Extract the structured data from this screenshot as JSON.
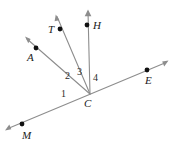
{
  "figure": {
    "type": "geometry-ray-diagram",
    "background_color": "#ffffff",
    "line_color": "#8d8d8d",
    "dot_color": "#111111",
    "label_color": "#1a1a1a"
  },
  "vertex": {
    "name": "C",
    "label": "C",
    "x": 90,
    "y": 94,
    "label_x": 92,
    "label_y": 106
  },
  "points": [
    {
      "name": "A",
      "label": "A",
      "dot_x": 36,
      "dot_y": 48,
      "label_x": 27,
      "label_y": 61,
      "arrow_x": 25,
      "arrow_y": 37
    },
    {
      "name": "T",
      "label": "T",
      "dot_x": 60,
      "dot_y": 29,
      "label_x": 48,
      "label_y": 33,
      "arrow_x": 56,
      "arrow_y": 15
    },
    {
      "name": "H",
      "label": "H",
      "dot_x": 87,
      "dot_y": 25,
      "label_x": 93,
      "label_y": 29,
      "arrow_x": 88,
      "arrow_y": 10
    },
    {
      "name": "E",
      "label": "E",
      "dot_x": 147,
      "dot_y": 70,
      "label_x": 145,
      "label_y": 84,
      "arrow_x": 168,
      "arrow_y": 61
    },
    {
      "name": "M",
      "label": "M",
      "dot_x": 22,
      "dot_y": 124,
      "label_x": 22,
      "label_y": 139,
      "arrow_x": 6,
      "arrow_y": 130
    }
  ],
  "angles": [
    {
      "label": "1",
      "x": 64,
      "y": 94
    },
    {
      "label": "2",
      "x": 68,
      "y": 76
    },
    {
      "label": "3",
      "x": 80,
      "y": 72
    },
    {
      "label": "4",
      "x": 96,
      "y": 78
    }
  ],
  "rays": [
    {
      "name": "ray-CA",
      "from": "C",
      "to": "A"
    },
    {
      "name": "ray-CT",
      "from": "C",
      "to": "T"
    },
    {
      "name": "ray-CH",
      "from": "C",
      "to": "H"
    },
    {
      "name": "line-MCE-right",
      "from": "C",
      "to": "E"
    },
    {
      "name": "line-MCE-left",
      "from": "C",
      "to": "M"
    }
  ]
}
